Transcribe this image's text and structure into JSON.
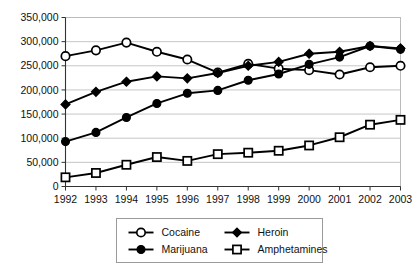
{
  "chart_data": {
    "type": "line",
    "title": "",
    "subtitle": "",
    "xlabel": "",
    "ylabel": "",
    "x": [
      1992,
      1993,
      1994,
      1995,
      1996,
      1997,
      1998,
      1999,
      2000,
      2001,
      2002,
      2003
    ],
    "categories": [
      "1992",
      "1993",
      "1994",
      "1995",
      "1996",
      "1997",
      "1998",
      "1999",
      "2000",
      "2001",
      "2002",
      "2003"
    ],
    "ylim": [
      0,
      350000
    ],
    "ytick_values": [
      0,
      50000,
      100000,
      150000,
      200000,
      250000,
      300000,
      350000
    ],
    "ytick_labels": [
      "0",
      "50,000",
      "100,000",
      "150,000",
      "200,000",
      "250,000",
      "300,000",
      "350,000"
    ],
    "grid": true,
    "legend_position": "bottom",
    "series": [
      {
        "name": "Cocaine",
        "marker": "open-circle",
        "values": [
          270000,
          282000,
          298000,
          279000,
          263000,
          236000,
          254000,
          244000,
          241000,
          232000,
          247000,
          250000
        ]
      },
      {
        "name": "Heroin",
        "marker": "filled-diamond",
        "values": [
          170000,
          196000,
          217000,
          228000,
          224000,
          235000,
          250000,
          258000,
          275000,
          279000,
          291000,
          286000
        ]
      },
      {
        "name": "Marijuana",
        "marker": "filled-circle",
        "values": [
          93000,
          112000,
          143000,
          172000,
          193000,
          199000,
          220000,
          233000,
          253000,
          268000,
          291000,
          284000
        ]
      },
      {
        "name": "Amphetamines",
        "marker": "open-square",
        "values": [
          19000,
          28000,
          45000,
          61000,
          53000,
          67000,
          70000,
          74000,
          85000,
          102000,
          128000,
          138000
        ]
      }
    ]
  },
  "legend": {
    "entries": [
      {
        "label": "Cocaine",
        "marker": "open-circle"
      },
      {
        "label": "Heroin",
        "marker": "filled-diamond"
      },
      {
        "label": "Marijuana",
        "marker": "filled-circle"
      },
      {
        "label": "Amphetamines",
        "marker": "open-square"
      }
    ]
  }
}
